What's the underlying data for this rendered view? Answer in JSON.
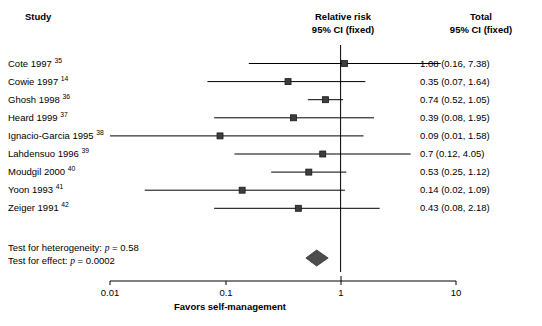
{
  "figure": {
    "type": "forest-plot",
    "width": 542,
    "height": 326
  },
  "headers": {
    "study": "Study",
    "center_line1": "Relative risk",
    "center_line2": "95% CI (fixed)",
    "total_line1": "Total",
    "total_line2": "95% CI (fixed)"
  },
  "axis": {
    "scale": "log10",
    "ticks": [
      "0.01",
      "0.1",
      "1",
      "10"
    ],
    "tick_values": [
      0.01,
      0.1,
      1,
      10
    ],
    "tick_x": [
      110,
      226,
      341,
      456
    ],
    "caption": "Favors self-management",
    "reference_value": 1
  },
  "stats": {
    "heterogeneity_prefix": "Test for heterogeneity: ",
    "heterogeneity_p_symbol": "p",
    "heterogeneity_value": " = 0.58",
    "effect_prefix": "Test for effect: ",
    "effect_p_symbol": "p",
    "effect_value": " = 0.0002"
  },
  "summary": {
    "estimate": 0.62,
    "ci_low": 0.5,
    "ci_high": 0.78,
    "shape": "diamond",
    "color": "#4d4d4d"
  },
  "chart_data": {
    "type": "forest",
    "title": "Relative risk 95% CI (fixed)",
    "xlabel": "Favors self-management",
    "ylabel": "Study",
    "xscale": "log",
    "xlim": [
      0.01,
      10
    ],
    "xticks": [
      0.01,
      0.1,
      1,
      10
    ],
    "reference_line": 1,
    "grid": false,
    "legend": "none",
    "columns": [
      "Study",
      "Relative risk 95% CI (fixed)",
      "Total 95% CI (fixed)"
    ],
    "rows": [
      {
        "study": "Cote 1997",
        "ref": "35",
        "estimate": 1.08,
        "ci_low": 0.16,
        "ci_high": 7.38,
        "total": "1.08 (0.16, 7.38)"
      },
      {
        "study": "Cowie 1997",
        "ref": "14",
        "estimate": 0.35,
        "ci_low": 0.07,
        "ci_high": 1.64,
        "total": "0.35 (0.07, 1.64)"
      },
      {
        "study": "Ghosh 1998",
        "ref": "36",
        "estimate": 0.74,
        "ci_low": 0.52,
        "ci_high": 1.05,
        "total": "0.74 (0.52, 1.05)"
      },
      {
        "study": "Heard 1999",
        "ref": "37",
        "estimate": 0.39,
        "ci_low": 0.08,
        "ci_high": 1.95,
        "total": "0.39 (0.08, 1.95)"
      },
      {
        "study": "Ignacio-Garcia 1995",
        "ref": "38",
        "estimate": 0.09,
        "ci_low": 0.01,
        "ci_high": 1.58,
        "total": "0.09 (0.01, 1.58)"
      },
      {
        "study": "Lahdensuo 1996",
        "ref": "39",
        "estimate": 0.7,
        "ci_low": 0.12,
        "ci_high": 4.05,
        "total": "0.7 (0.12, 4.05)"
      },
      {
        "study": "Moudgil 2000",
        "ref": "40",
        "estimate": 0.53,
        "ci_low": 0.25,
        "ci_high": 1.12,
        "total": "0.53 (0.25, 1.12)"
      },
      {
        "study": "Yoon 1993",
        "ref": "41",
        "estimate": 0.14,
        "ci_low": 0.02,
        "ci_high": 1.09,
        "total": "0.14 (0.02, 1.09)"
      },
      {
        "study": "Zeiger 1991",
        "ref": "42",
        "estimate": 0.43,
        "ci_low": 0.08,
        "ci_high": 2.18,
        "total": "0.43 (0.08, 2.18)"
      }
    ],
    "summary": {
      "label": "Pooled (fixed)",
      "estimate": 0.62,
      "ci_low": 0.5,
      "ci_high": 0.78
    },
    "annotations": [
      "Test for heterogeneity: p = 0.58",
      "Test for effect: p = 0.0002"
    ]
  },
  "style": {
    "marker_color": "#3d3d3d",
    "line_color": "#000000",
    "axis_color": "#000000"
  }
}
